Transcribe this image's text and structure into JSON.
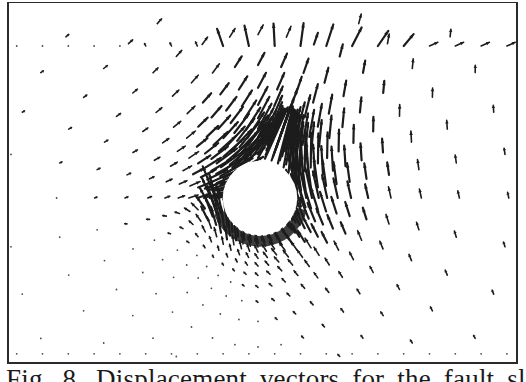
{
  "figure": {
    "caption": "Fig. 8.  Displacement vectors  for the  fault  slip  called",
    "ink_color": "#1c1c1c",
    "dot_color": "#4a4a4a",
    "background": "#ffffff"
  },
  "chart_data": {
    "type": "vector-field",
    "title": "",
    "xlabel": "",
    "ylabel": "",
    "cavity": {
      "shape": "circle",
      "center": [
        0,
        0
      ],
      "radius": 1.0
    },
    "domain": {
      "x_range": [
        -6.5,
        6.7
      ],
      "y_range": [
        -4.2,
        4.1
      ]
    },
    "mesh": {
      "spokes": 36,
      "ring_radii": [
        1.05,
        1.15,
        1.27,
        1.42,
        1.6,
        1.82,
        2.1,
        2.45,
        2.9,
        3.5,
        4.3,
        5.3,
        6.6
      ],
      "outer_boundary_rows": {
        "top_y": 4.0,
        "bottom_y": -4.1
      }
    },
    "displacement_model": {
      "dominant_direction_deg": 62,
      "left_rim_direction_deg": 8,
      "peak_magnitude": 1.0,
      "peak_angle_deg": 55,
      "angular_spread_deg": 70,
      "radial_decay_exponent": 1.1
    },
    "grid": false,
    "legend": "none"
  }
}
